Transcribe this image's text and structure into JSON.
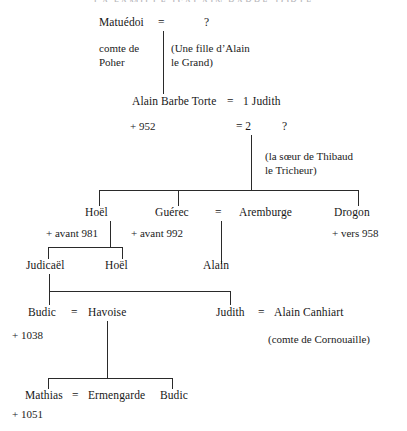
{
  "title": "LA FAMILLE D'ALAIN BARBE TORTE",
  "diagram": {
    "type": "genealogy-tree",
    "generations": [
      {
        "level": 1,
        "people": [
          {
            "name": "Matuédoi",
            "note": "comte de\nPoher"
          },
          {
            "name": "?",
            "note": "(Une fille d’Alain\nle Grand)"
          }
        ],
        "union": "="
      },
      {
        "level": 2,
        "people": [
          {
            "name": "Alain Barbe Torte",
            "note": "+ 952"
          },
          {
            "name": "1 Judith",
            "note": ""
          },
          {
            "name": "?",
            "note": "(la sœur de Thibaud\nle Tricheur)"
          }
        ],
        "unions": [
          "=",
          "= 2"
        ]
      },
      {
        "level": 3,
        "people": [
          {
            "name": "Hoël",
            "note": "+ avant 981"
          },
          {
            "name": "Guérec",
            "note": "+ avant 992"
          },
          {
            "name": "Aremburge",
            "note": ""
          },
          {
            "name": "Drogon",
            "note": "+ vers 958"
          }
        ],
        "union": "="
      },
      {
        "level": 4,
        "people": [
          {
            "name": "Judicaël",
            "note": ""
          },
          {
            "name": "Hoël",
            "note": ""
          },
          {
            "name": "Alain",
            "note": ""
          }
        ]
      },
      {
        "level": 5,
        "people": [
          {
            "name": "Budic",
            "note": "+ 1038"
          },
          {
            "name": "Havoise",
            "note": ""
          },
          {
            "name": "Judith",
            "note": ""
          },
          {
            "name": "Alain Canhiart",
            "note": "(comte de Cornouaille)"
          }
        ],
        "unions": [
          "=",
          "="
        ]
      },
      {
        "level": 6,
        "people": [
          {
            "name": "Mathias",
            "note": "+ 1051"
          },
          {
            "name": "Ermengarde",
            "note": ""
          },
          {
            "name": "Budic",
            "note": ""
          }
        ],
        "union": "="
      }
    ]
  },
  "labels": {
    "matuedoi": "Matuédoi",
    "matuedoi_eq": "=",
    "spouse1_unknown": "?",
    "comte_de": "comte de",
    "poher": "Poher",
    "fille_alain_1": "(Une fille d’Alain",
    "fille_alain_2": "le Grand)",
    "alain_barbe_torte": "Alain Barbe Torte",
    "abt_eq": "=",
    "judith1": "1 Judith",
    "death_952": "+  952",
    "eq2": "= 2",
    "spouse2_unknown": "?",
    "soeur_thibaud_1": "(la sœur de Thibaud",
    "soeur_thibaud_2": "le Tricheur)",
    "hoel1": "Hoël",
    "guerec": "Guérec",
    "guerec_eq": "=",
    "aremburge": "Aremburge",
    "drogon": "Drogon",
    "avant_981": "+ avant 981",
    "avant_992": "+ avant 992",
    "vers_958": "+  vers 958",
    "judicael": "Judicaël",
    "hoel2": "Hoël",
    "alain": "Alain",
    "budic1": "Budic",
    "budic_eq": "=",
    "havoise": "Havoise",
    "death_1038": "+  1038",
    "judith2": "Judith",
    "judith_eq": "=",
    "alain_canhiart": "Alain Canhiart",
    "comte_cornouaille": "(comte de Cornouaille)",
    "mathias": "Mathias",
    "mathias_eq": "=",
    "ermengarde": "Ermengarde",
    "death_1051": "+  1051",
    "budic2": "Budic"
  }
}
